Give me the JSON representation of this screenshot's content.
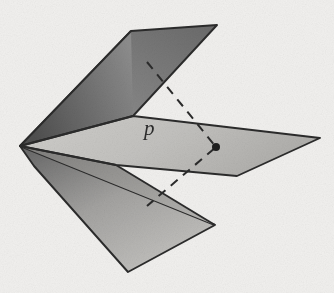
{
  "figure": {
    "background_color": "#f1f0ee",
    "ink_color": "#2b2b2b",
    "labels": [
      {
        "name": "point-p",
        "text": "p",
        "x": 152,
        "y": 131,
        "style": "italic-serif"
      }
    ],
    "apex": {
      "x": 20,
      "y": 146
    },
    "marked_point": {
      "name": "p",
      "x": 216,
      "y": 147,
      "radius": 4
    },
    "surfaces": [
      {
        "name": "upper-back-panel",
        "fill_from": "#8f8f8f",
        "fill_to": "#6c6c6c",
        "points": "20,146 131,31 217,25 133,116"
      },
      {
        "name": "upper-front-panel",
        "fill_from": "#585858",
        "fill_to": "#8a8a8a",
        "points": "20,146 131,31 133,116 133,133"
      },
      {
        "name": "middle-horizontal-plane",
        "fill_from": "#c9c8c5",
        "fill_to": "#b3b2af",
        "points": "20,146 133,116 320,138 237,176 116,165"
      },
      {
        "name": "lower-panel",
        "fill_from": "#6e6e6e",
        "fill_to": "#c2c1be",
        "points": "20,146 215,225 128,272 34,166"
      },
      {
        "name": "lower-panel-upper-wedge",
        "fill_from": "#8b8a88",
        "fill_to": "#b9b8b5",
        "points": "20,146 215,225 116,165"
      }
    ],
    "dashed_line": {
      "name": "transversal-line",
      "dash_pattern": "9 7",
      "stroke_width": 2,
      "segments": [
        {
          "from": {
            "x": 147,
            "y": 62
          },
          "to": {
            "x": 216,
            "y": 147
          }
        },
        {
          "from": {
            "x": 216,
            "y": 147
          },
          "to": {
            "x": 147,
            "y": 206
          }
        }
      ]
    },
    "edges": [
      {
        "name": "edge-apex-to-top-left",
        "from": {
          "x": 20,
          "y": 146
        },
        "to": {
          "x": 131,
          "y": 31
        }
      },
      {
        "name": "edge-top",
        "from": {
          "x": 131,
          "y": 31
        },
        "to": {
          "x": 217,
          "y": 25
        }
      },
      {
        "name": "edge-top-right-down",
        "from": {
          "x": 217,
          "y": 25
        },
        "to": {
          "x": 133,
          "y": 116
        }
      },
      {
        "name": "edge-fold-upper",
        "from": {
          "x": 133,
          "y": 116
        },
        "to": {
          "x": 20,
          "y": 146
        }
      },
      {
        "name": "edge-mid-top",
        "from": {
          "x": 133,
          "y": 116
        },
        "to": {
          "x": 320,
          "y": 138
        }
      },
      {
        "name": "edge-mid-right",
        "from": {
          "x": 320,
          "y": 138
        },
        "to": {
          "x": 237,
          "y": 176
        }
      },
      {
        "name": "edge-mid-bottom",
        "from": {
          "x": 237,
          "y": 176
        },
        "to": {
          "x": 116,
          "y": 165
        }
      },
      {
        "name": "edge-mid-bottom-left",
        "from": {
          "x": 116,
          "y": 165
        },
        "to": {
          "x": 20,
          "y": 146
        }
      },
      {
        "name": "edge-lower-right",
        "from": {
          "x": 116,
          "y": 165
        },
        "to": {
          "x": 215,
          "y": 225
        }
      },
      {
        "name": "edge-lower-bottom",
        "from": {
          "x": 215,
          "y": 225
        },
        "to": {
          "x": 128,
          "y": 272
        }
      },
      {
        "name": "edge-lower-left",
        "from": {
          "x": 128,
          "y": 272
        },
        "to": {
          "x": 20,
          "y": 146
        }
      }
    ]
  }
}
